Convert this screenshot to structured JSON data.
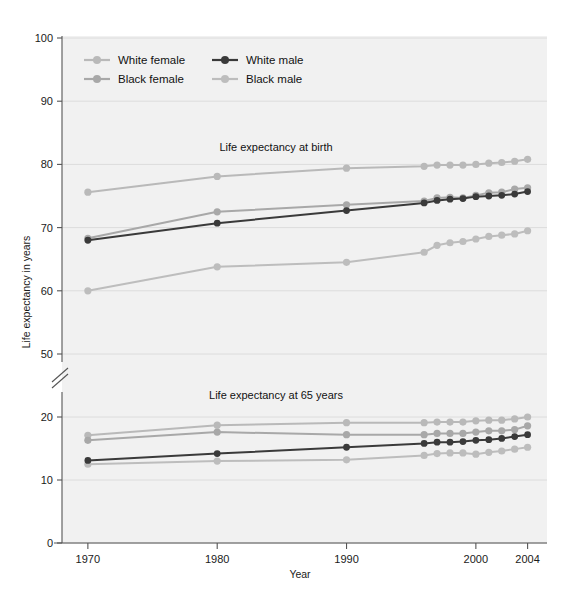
{
  "chart_data": {
    "type": "line",
    "title": "",
    "xlabel": "Year",
    "ylabel": "Life expectancy in years",
    "xlim": [
      1968,
      2005.5
    ],
    "x_ticks": [
      1970,
      1980,
      1990,
      2000,
      2004
    ],
    "x_tick_labels": [
      "1970",
      "1980",
      "1990",
      "2000",
      "2004"
    ],
    "y_tick_labels_upper": [
      "100",
      "90",
      "80",
      "70",
      "60",
      "50"
    ],
    "y_ticks_upper": [
      100,
      90,
      80,
      70,
      60,
      50
    ],
    "y_tick_labels_lower": [
      "20",
      "10",
      "0"
    ],
    "y_ticks_lower": [
      20,
      10,
      0
    ],
    "axis_break": true,
    "grid": "horizontal",
    "legend_position": "top-left-inside",
    "panels": [
      {
        "name": "upper",
        "panel_title": "Life expectancy at birth",
        "series": [
          {
            "name": "White female",
            "color": "#b9b9b9",
            "x": [
              1970,
              1980,
              1990,
              1996,
              1997,
              1998,
              1999,
              2000,
              2001,
              2002,
              2003,
              2004
            ],
            "values": [
              75.6,
              78.1,
              79.4,
              79.7,
              79.9,
              79.9,
              79.9,
              80.0,
              80.2,
              80.3,
              80.5,
              80.8
            ]
          },
          {
            "name": "Black female",
            "color": "#a8a8a8",
            "x": [
              1970,
              1980,
              1990,
              1996,
              1997,
              1998,
              1999,
              2000,
              2001,
              2002,
              2003,
              2004
            ],
            "values": [
              68.3,
              72.5,
              73.6,
              74.2,
              74.7,
              74.8,
              74.7,
              75.1,
              75.5,
              75.6,
              76.1,
              76.3
            ]
          },
          {
            "name": "White male",
            "color": "#3a3a3a",
            "x": [
              1970,
              1980,
              1990,
              1996,
              1997,
              1998,
              1999,
              2000,
              2001,
              2002,
              2003,
              2004
            ],
            "values": [
              68.0,
              70.7,
              72.7,
              73.9,
              74.3,
              74.5,
              74.6,
              74.9,
              75.0,
              75.1,
              75.3,
              75.7
            ]
          },
          {
            "name": "Black male",
            "color": "#bdbdbd",
            "x": [
              1970,
              1980,
              1990,
              1996,
              1997,
              1998,
              1999,
              2000,
              2001,
              2002,
              2003,
              2004
            ],
            "values": [
              60.0,
              63.8,
              64.5,
              66.1,
              67.2,
              67.6,
              67.8,
              68.2,
              68.6,
              68.8,
              69.0,
              69.5
            ]
          }
        ]
      },
      {
        "name": "lower",
        "panel_title": "Life expectancy at 65 years",
        "series": [
          {
            "name": "White female",
            "color": "#b9b9b9",
            "x": [
              1970,
              1980,
              1990,
              1996,
              1997,
              1998,
              1999,
              2000,
              2001,
              2002,
              2003,
              2004
            ],
            "values": [
              17.1,
              18.7,
              19.1,
              19.1,
              19.2,
              19.2,
              19.2,
              19.4,
              19.5,
              19.5,
              19.7,
              20.0
            ]
          },
          {
            "name": "Black female",
            "color": "#a8a8a8",
            "x": [
              1970,
              1980,
              1990,
              1996,
              1997,
              1998,
              1999,
              2000,
              2001,
              2002,
              2003,
              2004
            ],
            "values": [
              16.3,
              17.6,
              17.2,
              17.2,
              17.4,
              17.4,
              17.4,
              17.6,
              17.8,
              17.8,
              18.0,
              18.6
            ]
          },
          {
            "name": "White male",
            "color": "#3a3a3a",
            "x": [
              1970,
              1980,
              1990,
              1996,
              1997,
              1998,
              1999,
              2000,
              2001,
              2002,
              2003,
              2004
            ],
            "values": [
              13.1,
              14.2,
              15.2,
              15.8,
              16.0,
              16.0,
              16.1,
              16.3,
              16.4,
              16.6,
              16.9,
              17.2
            ]
          },
          {
            "name": "Black male",
            "color": "#bdbdbd",
            "x": [
              1970,
              1980,
              1990,
              1996,
              1997,
              1998,
              1999,
              2000,
              2001,
              2002,
              2003,
              2004
            ],
            "values": [
              12.5,
              13.0,
              13.2,
              13.9,
              14.2,
              14.3,
              14.3,
              14.1,
              14.4,
              14.6,
              14.9,
              15.2
            ]
          }
        ]
      }
    ],
    "legend": [
      {
        "label": "White female",
        "color": "#b9b9b9"
      },
      {
        "label": "White male",
        "color": "#3a3a3a"
      },
      {
        "label": "Black female",
        "color": "#a8a8a8"
      },
      {
        "label": "Black male",
        "color": "#bdbdbd"
      }
    ],
    "colors": {
      "plot_background": "#f1f1f1",
      "gridline": "#dcdcdc",
      "axis": "#555555",
      "text": "#1a1a1a"
    }
  }
}
